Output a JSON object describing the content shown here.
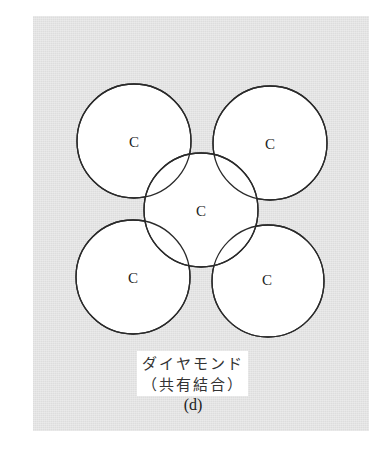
{
  "figure": {
    "panel_color": "#e4e4e4",
    "atoms": [
      {
        "id": "top-left",
        "label": "C"
      },
      {
        "id": "top-right",
        "label": "C"
      },
      {
        "id": "center",
        "label": "C"
      },
      {
        "id": "bottom-left",
        "label": "C"
      },
      {
        "id": "bottom-right",
        "label": "C"
      }
    ],
    "caption": {
      "title": "ダイヤモンド",
      "subtitle": "（共有結合）",
      "tag": "(d)"
    }
  }
}
